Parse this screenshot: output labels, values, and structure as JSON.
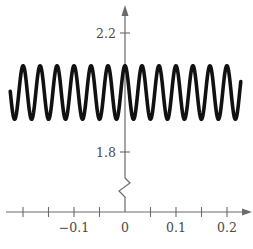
{
  "chart_data": {
    "type": "line",
    "title": "",
    "xlabel": "",
    "ylabel": "",
    "function": "y = 2 + 0.1*cos(60*pi*x)",
    "series": [
      {
        "name": "curve",
        "x_range": [
          -0.225,
          0.227
        ],
        "midline": 2.0,
        "amplitude": 0.1,
        "period": 0.0333,
        "peak_at_x": 0
      }
    ],
    "xlim": [
      -0.25,
      0.25
    ],
    "x_ticks": [
      -0.2,
      -0.15,
      -0.1,
      -0.05,
      0,
      0.05,
      0.1,
      0.15,
      0.2
    ],
    "x_tick_labels": [
      {
        "value": -0.1,
        "label": "−0.1"
      },
      {
        "value": 0,
        "label": "0"
      },
      {
        "value": 0.1,
        "label": "0.1"
      },
      {
        "value": 0.2,
        "label": "0.2"
      }
    ],
    "y_ticks": [
      {
        "value": 2.2,
        "label": "2.2"
      },
      {
        "value": 1.8,
        "label": "1.8"
      }
    ],
    "y_axis_break": true,
    "grid": false,
    "legend": null
  },
  "layout": {
    "origin_px": [
      125,
      212
    ],
    "x_px_per_unit": 510,
    "y_ref": {
      "value": 2.2,
      "px": 33
    },
    "y_px_per_unit": 297.5,
    "y_axis_top_px": 5,
    "x_axis_left_px": 6,
    "x_axis_right_px": 252
  },
  "colors": {
    "curve": "#111111",
    "axis": "#6b6b6b",
    "label": "#4a4a4a"
  }
}
